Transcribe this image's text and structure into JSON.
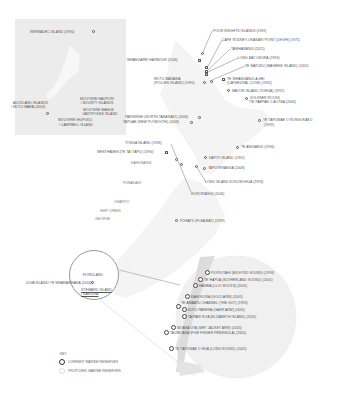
{
  "inset": {
    "labels": {
      "kermadec": "KERMADEC ISLAND (1990)",
      "auckland_1": "AUCKLAND ISLANDS",
      "auckland_2": "/ MOTU MAHA (2003)",
      "bounty_1": "MOUTERE HAUPURI",
      "bounty_2": "/ BOUNTY ISLANDS",
      "antipodes_1": "MOUTERE MAHUE",
      "antipodes_2": "/ ANTIPODES ISLAND",
      "campbell_1": "MOUTERE IHUPUKU",
      "campbell_2": "/ CAMPBELL ISLAND"
    }
  },
  "north_island": {
    "poor_knights": "POOR KNIGHTS ISLANDS (1981)",
    "cape_rodney": "CAPE RODNEY-OKAKARI POINT (LEIGH) (1975)",
    "tawharanui": "TAWHARANUI (2011)",
    "long_bay": "LONG BAY-OKURA (1994)",
    "te_matuku": "TE MATUKU (WAIHEKE ISLAND) (2005)",
    "whangarei": "WHANGAREI HARBOUR (2006)",
    "motu_manawa_1": "MOTU MANAWA",
    "motu_manawa_2": "(POLLEN ISLAND) (1995)",
    "te_whanganui_1": "TE WHANGANUI-A-HEI",
    "te_whanganui_2": "(CATHEDRAL COVE) (1992)",
    "mayor_island": "MAYOR ISLAND (TUHUA) (1992)",
    "volkner_1": "MOTUKAWAO (VOLKNER ROCKS)",
    "volkner_1_short": "VOLKNER ROCKS",
    "volkner_2": "/TE PAEPAE O AOTEA (2006)",
    "te_tapuwae_rongokako_1": "TE TAPUWAE O RONGOKAKO",
    "te_tapuwae_rongokako_2": "(1999)",
    "parininihi": "PARININIHI (NORTH TARANAKI) (2006)",
    "tapuae": "TAPUAE (NEW PLYMOUTH) (2008)",
    "te_angiangi": "TE ANGIANGI (1996)",
    "kapiti": "KAPITI ISLAND (1992)",
    "taputeranga": "TAPUTERANGA (2008)",
    "long_island": "LONG ISLAND-KOKOMOHUA (1993)",
    "horoirangi": "HOROIRANGI (2006)",
    "tonga_island": "TONGA ISLAND (1993)",
    "westhaven": "WESTHAVEN (TE TAI TAPU) (1994)",
    "kahurangi": "KAHURANGI",
    "punakaiki": "PUNAKAIKI",
    "okarito": "OKARITO",
    "ship_creek": "SHIP CREEK",
    "orofieo": "GEORGE",
    "pohatu": "POHATU (FLEA BAY) (1999)"
  },
  "south": {
    "fiordland": "FIORDLAND",
    "ulva": "ULVA ISLAND/ TE WHARAWHARA (2004)",
    "stewart_1": "STEWARD ISLAND",
    "stewart_2": "/ RAKIURA"
  },
  "fiordland_detail": {
    "items": [
      "PIOPIOTAHI (MILFORD SOUND) (1993)",
      "TE HAPUA (SUTHERLAND SOUND) (2005)",
      "HAWEA (CLIO ROCKS) (2005)",
      "KAHUKURA (GOLD ARM) (2005)",
      "TE AWAATU CHANNEL (THE GUT) (1993)",
      "KUTU PARERA (GAER ARM) (2005)",
      "TAIPARI ROA (ELIZABETH ISLAND) (2005)",
      "MOANA UTA (WET JACKET ARM) (2005)",
      "TAUMOANA (FIVE FINGER PENINSULA) (2005)",
      "TE TAPUWAE O HUA (LONG SOUND) (2005)"
    ]
  },
  "key": {
    "title": "KEY",
    "current": "CURRENT MARINE RESERVES",
    "proposed": "PROPOSED MARINE RESERVES"
  },
  "colors": {
    "land_light": "#f3f3f3",
    "land_mid": "#e6e6e6",
    "inset_bg": "#ececec",
    "marker": "#555555",
    "text": "#555555"
  }
}
